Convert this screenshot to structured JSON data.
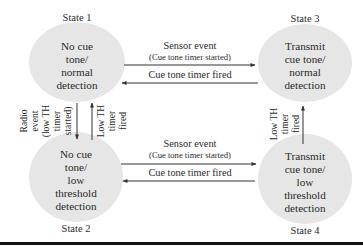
{
  "diagram": {
    "type": "state-transition",
    "colors": {
      "node_fill": "#e6e6e6",
      "line": "#333333",
      "bottom_rule": "#111111",
      "background": "#ffffff"
    },
    "states": [
      {
        "id": "state1",
        "label": "State 1",
        "lines": [
          "No cue",
          "tone/",
          "normal",
          "detection"
        ]
      },
      {
        "id": "state2",
        "label": "State 2",
        "lines": [
          "No cue",
          "tone/",
          "low",
          "threshold",
          "detection"
        ]
      },
      {
        "id": "state3",
        "label": "State 3",
        "lines": [
          "Transmit",
          "cue tone/",
          "normal",
          "detection"
        ]
      },
      {
        "id": "state4",
        "label": "State 4",
        "lines": [
          "Transmit",
          "cue tone/",
          "low",
          "threshold",
          "detection"
        ]
      }
    ],
    "transitions": {
      "s1_to_s3": {
        "label": "Sensor event",
        "sub": "(Cue tone timer started)"
      },
      "s3_to_s1": {
        "label": "Cue tone timer fired"
      },
      "s2_to_s4": {
        "label": "Sensor event",
        "sub": "(Cue tone timer started)"
      },
      "s4_to_s2": {
        "label": "Cue tone timer fired"
      },
      "s1_to_s2": {
        "lines": [
          "Radio",
          "event",
          "(low TH",
          "timer",
          "started)"
        ]
      },
      "s2_to_s1": {
        "lines": [
          "Low TH",
          "timer",
          "fired"
        ]
      },
      "s4_to_s3": {
        "lines": [
          "Low TH",
          "timer",
          "fired"
        ]
      }
    }
  }
}
